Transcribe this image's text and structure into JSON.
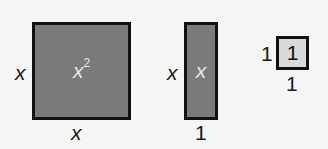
{
  "diagram": {
    "tiles": [
      {
        "name": "x-squared tile",
        "inner_base": "x",
        "inner_exp": "2",
        "side_label": "x",
        "bottom_label": "x",
        "fill": "#7a7a7a"
      },
      {
        "name": "x tile",
        "inner": "x",
        "side_label": "x",
        "bottom_label": "1",
        "fill": "#7a7a7a"
      },
      {
        "name": "unit tile",
        "inner": "1",
        "side_label": "1",
        "bottom_label": "1",
        "fill": "#d9d9d9"
      }
    ]
  }
}
